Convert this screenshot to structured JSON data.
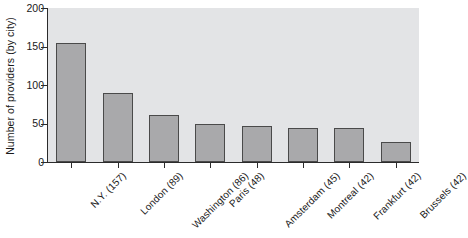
{
  "chart_data": {
    "type": "bar",
    "title": "",
    "xlabel": "",
    "ylabel": "Number of providers (by city)",
    "ylim": [
      0,
      200
    ],
    "yticks": [
      0,
      50,
      100,
      150,
      200
    ],
    "grid": false,
    "legend": null,
    "categories": [
      "N.Y. (157)",
      "London (89)",
      "Washington (86)",
      "Paris (48)",
      "Amsterdam (45)",
      "Montreal (42)",
      "Frankfurt (42)",
      "Brussels (42)"
    ],
    "values": [
      155,
      90,
      61,
      49,
      47,
      44,
      44,
      26
    ],
    "colors": {
      "bar_fill": "#a9a9ab",
      "bar_edge": "#4a4a4a",
      "plot_background": "#e3e4e6",
      "axis": "#2b2b2b",
      "text": "#1a1a1a",
      "figure_background": "#ffffff"
    }
  }
}
